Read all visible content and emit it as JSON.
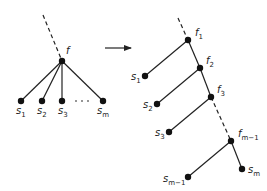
{
  "diagram": {
    "left_tree": {
      "root": {
        "label": "f",
        "x": 62,
        "y": 61
      },
      "leaves": [
        {
          "label": "s",
          "sub": "1",
          "x": 21,
          "y": 101
        },
        {
          "label": "s",
          "sub": "2",
          "x": 42,
          "y": 101
        },
        {
          "label": "s",
          "sub": "3",
          "x": 62,
          "y": 101
        },
        {
          "label": "s",
          "sub": "m",
          "x": 103,
          "y": 101
        }
      ],
      "ellipsis": "· · ·"
    },
    "arrow": {
      "from": [
        105,
        48
      ],
      "to": [
        131,
        48
      ]
    },
    "right_tree": {
      "spine": [
        {
          "label": "f",
          "sub": "1",
          "x": 188,
          "y": 40
        },
        {
          "label": "f",
          "sub": "2",
          "x": 200,
          "y": 68
        },
        {
          "label": "f",
          "sub": "3",
          "x": 211,
          "y": 97
        },
        {
          "label": "f",
          "sub": "m−1",
          "x": 231,
          "y": 141
        }
      ],
      "leaves": [
        {
          "label": "s",
          "sub": "1",
          "x": 145,
          "y": 76
        },
        {
          "label": "s",
          "sub": "2",
          "x": 157,
          "y": 104
        },
        {
          "label": "s",
          "sub": "3",
          "x": 169,
          "y": 132
        },
        {
          "label": "s",
          "sub": "m−1",
          "x": 188,
          "y": 177
        },
        {
          "label": "s",
          "sub": "m",
          "x": 242,
          "y": 169
        }
      ]
    },
    "colors": {
      "stroke": "#222222",
      "node": "#111111"
    }
  }
}
